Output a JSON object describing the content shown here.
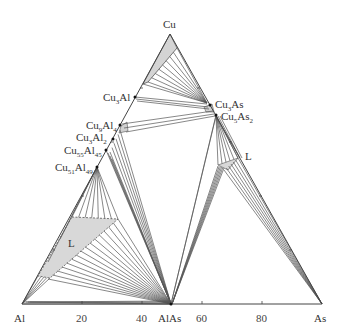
{
  "diagram": {
    "type": "ternary-phase-diagram",
    "vertices": {
      "top": "Cu",
      "left": "Al",
      "right": "As"
    },
    "bottom_axis": {
      "ticks": [
        "20",
        "40",
        "60",
        "80"
      ],
      "midpoint_label": "AlAs"
    },
    "phases": [
      {
        "label": "Cu3Al",
        "base": "Cu",
        "sub1": "3",
        "el2": "Al",
        "sub2": ""
      },
      {
        "label": "Cu9Al4",
        "base": "Cu",
        "sub1": "9",
        "el2": "Al",
        "sub2": "4"
      },
      {
        "label": "Cu3Al2",
        "base": "Cu",
        "sub1": "3",
        "el2": "Al",
        "sub2": "2"
      },
      {
        "label": "Cu55Al45",
        "base": "Cu",
        "sub1": "55",
        "el2": "Al",
        "sub2": "45"
      },
      {
        "label": "Cu51Al49",
        "base": "Cu",
        "sub1": "51",
        "el2": "Al",
        "sub2": "49"
      },
      {
        "label": "Cu3As",
        "base": "Cu",
        "sub1": "3",
        "el2": "As",
        "sub2": ""
      },
      {
        "label": "Cu5As2",
        "base": "Cu",
        "sub1": "5",
        "el2": "As",
        "sub2": "2"
      }
    ],
    "liquid_labels": [
      "L",
      "L"
    ],
    "colors": {
      "line": "#555555",
      "fill": "#d4d4d4",
      "point": "#111111"
    }
  }
}
